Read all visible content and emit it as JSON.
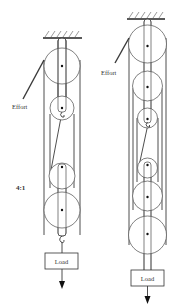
{
  "figure": {
    "left_system": {
      "effort_label": "Effort",
      "ratio_label": "4:1",
      "load_label": "Load",
      "pulleys_fixed": 2,
      "pulleys_moving": 2
    },
    "right_system": {
      "effort_label": "Effort",
      "load_label": "Load",
      "pulleys_fixed": 3,
      "pulleys_moving": 3
    }
  }
}
